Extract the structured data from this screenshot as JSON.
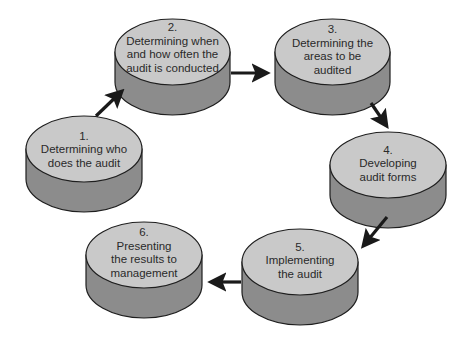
{
  "colors": {
    "background": "#ffffff",
    "top_face": "#c9c9c9",
    "side_face": "#8c8c8c",
    "outline": "#1e1e1e",
    "arrow": "#1a1a1a",
    "text": "#2a2a2a"
  },
  "steps": [
    {
      "number": "1.",
      "lines": [
        "Determining who",
        "does the audit"
      ]
    },
    {
      "number": "2.",
      "lines": [
        "Determining when",
        "and how often the",
        "audit is conducted"
      ]
    },
    {
      "number": "3.",
      "lines": [
        "Determining the",
        "areas to be",
        "audited"
      ]
    },
    {
      "number": "4.",
      "lines": [
        "Developing",
        "audit forms"
      ]
    },
    {
      "number": "5.",
      "lines": [
        "Implementing",
        "the audit"
      ]
    },
    {
      "number": "6.",
      "lines": [
        "Presenting",
        "the results to",
        "management"
      ]
    }
  ],
  "flow": [
    {
      "from": "1",
      "to": "2"
    },
    {
      "from": "2",
      "to": "3"
    },
    {
      "from": "3",
      "to": "4"
    },
    {
      "from": "4",
      "to": "5"
    },
    {
      "from": "5",
      "to": "6"
    }
  ]
}
